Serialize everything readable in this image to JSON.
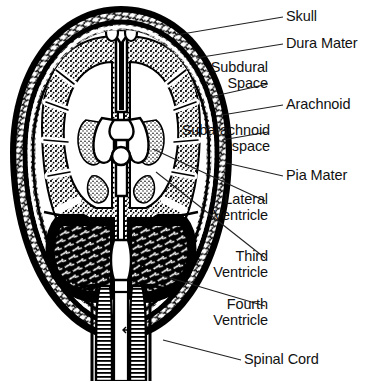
{
  "figure": {
    "type": "anatomical-line-drawing",
    "background_color": "#ffffff",
    "ink_color": "#000000",
    "label_color": "#111111"
  },
  "labels": [
    {
      "id": "skull",
      "text": "Skull",
      "lines": [
        "Skull"
      ],
      "align": "left",
      "x": 286,
      "y": 9,
      "leader": {
        "from": [
          283,
          17
        ],
        "to": [
          176,
          35
        ]
      }
    },
    {
      "id": "dura-mater",
      "text": "Dura Mater",
      "lines": [
        "Dura Mater"
      ],
      "align": "left",
      "x": 286,
      "y": 36,
      "leader": {
        "from": [
          283,
          44
        ],
        "to": [
          196,
          58
        ]
      }
    },
    {
      "id": "subdural-space",
      "text": "Subdural Space",
      "lines": [
        "Subdural",
        "Space"
      ],
      "align": "right",
      "x": 268,
      "y": 60,
      "leader": {
        "from": [
          268,
          84
        ],
        "to": [
          210,
          97
        ]
      }
    },
    {
      "id": "arachnoid",
      "text": "Arachnoid",
      "lines": [
        "Arachnoid"
      ],
      "align": "left",
      "x": 286,
      "y": 97,
      "leader": {
        "from": [
          283,
          105
        ],
        "to": [
          216,
          116
        ]
      }
    },
    {
      "id": "subarachnoid-space",
      "text": "Subarachnoid space",
      "lines": [
        "Subarachnoid",
        "space"
      ],
      "align": "right",
      "x": 270,
      "y": 123,
      "leader": {
        "from": [
          268,
          132
        ],
        "to": [
          222,
          140
        ]
      }
    },
    {
      "id": "pia-mater",
      "text": "Pia Mater",
      "lines": [
        "Pia Mater"
      ],
      "align": "left",
      "x": 286,
      "y": 168,
      "leader": {
        "from": [
          283,
          176
        ],
        "to": [
          226,
          163
        ]
      }
    },
    {
      "id": "lateral-ventricle",
      "text": "Lateral Ventricle",
      "lines": [
        "Lateral",
        "Ventricle"
      ],
      "align": "right",
      "x": 268,
      "y": 192,
      "leader": {
        "from": [
          265,
          201
        ],
        "to": [
          153,
          149
        ]
      }
    },
    {
      "id": "third-ventricle",
      "text": "Third Ventricle",
      "lines": [
        "Third",
        "Ventricle"
      ],
      "align": "right",
      "x": 268,
      "y": 249,
      "leader": {
        "from": [
          265,
          258
        ],
        "to": [
          156,
          172
        ]
      }
    },
    {
      "id": "fourth-ventricle",
      "text": "Fourth Ventricle",
      "lines": [
        "Fourth",
        "Ventricle"
      ],
      "align": "right",
      "x": 268,
      "y": 297,
      "leader": {
        "from": [
          265,
          306
        ],
        "to": [
          160,
          275
        ]
      }
    },
    {
      "id": "spinal-cord",
      "text": "Spinal Cord",
      "lines": [
        "Spinal Cord"
      ],
      "align": "left",
      "x": 244,
      "y": 352,
      "leader": {
        "from": [
          241,
          360
        ],
        "to": [
          163,
          340
        ]
      }
    }
  ]
}
